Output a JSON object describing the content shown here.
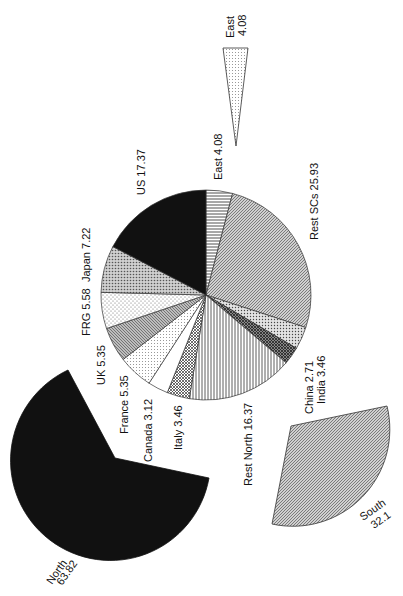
{
  "chart_data": [
    {
      "type": "pie",
      "title": "",
      "orientation_note": "page rotated 90 degrees counter-clockwise",
      "center": [
        206,
        295
      ],
      "radius": 105,
      "start_angle_deg": 0,
      "direction": "clockwise",
      "slices": [
        {
          "label": "East",
          "value": 4.08,
          "pattern": "hlines"
        },
        {
          "label": "Rest SCs",
          "value": 25.93,
          "pattern": "diag-dense"
        },
        {
          "label": "India",
          "value": 3.46,
          "pattern": "dots-cross"
        },
        {
          "label": "China",
          "value": 2.71,
          "pattern": "crosshatch-dark"
        },
        {
          "label": "Rest North",
          "value": 16.37,
          "pattern": "vlines"
        },
        {
          "label": "Italy",
          "value": 3.46,
          "pattern": "crosshatch"
        },
        {
          "label": "Canada",
          "value": 3.12,
          "pattern": "white"
        },
        {
          "label": "France",
          "value": 5.35,
          "pattern": "dots-light"
        },
        {
          "label": "UK",
          "value": 5.35,
          "pattern": "diag-gray"
        },
        {
          "label": "FRG",
          "value": 5.58,
          "pattern": "dots-sparse"
        },
        {
          "label": "Japan",
          "value": 7.22,
          "pattern": "dots-dense"
        },
        {
          "label": "US",
          "value": 17.37,
          "pattern": "solid-black"
        }
      ]
    },
    {
      "type": "pie",
      "title": "Region sectors (exploded)",
      "slices": [
        {
          "label": "North",
          "value": 63.82,
          "pattern": "solid-black"
        },
        {
          "label": "South",
          "value": 32.1,
          "pattern": "diag-dense"
        },
        {
          "label": "East",
          "value": 4.08,
          "pattern": "dots-light"
        }
      ]
    }
  ],
  "labels": {
    "main": {
      "east": "East  4.08",
      "rest_scs": "Rest SCs  25.93",
      "us": "US  17.37",
      "japan": "Japan  7.22",
      "frg": "FRG  5.58",
      "uk": "UK  5.35",
      "france": "France  5.35",
      "canada": "Canada  3.12",
      "italy": "Italy  3.46",
      "rest_north": "Rest North  16.37",
      "china": "China  2.71",
      "india": "India  3.46"
    },
    "regions": {
      "north_name": "North",
      "north_value": "63.82",
      "south_name": "South",
      "south_value": "32.1",
      "east_name": "East",
      "east_value": "4.08"
    }
  },
  "colors": {
    "ink": "#111111",
    "paper": "#ffffff",
    "mid_gray": "#9a9a9a"
  }
}
